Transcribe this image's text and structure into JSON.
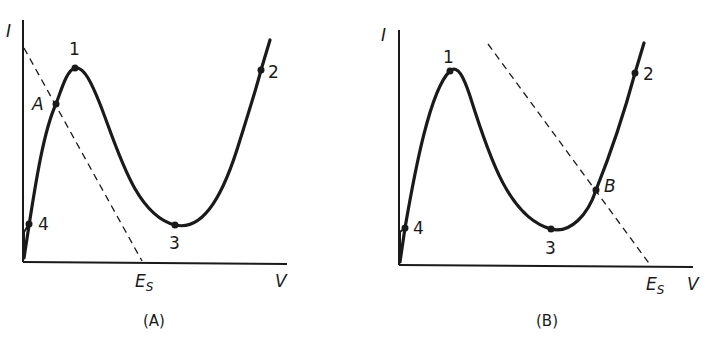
{
  "figure": {
    "panels": [
      {
        "caption": "(A)",
        "y_axis_label": "I",
        "x_axis_label": "V",
        "load_line_intercept_label": "E",
        "load_line_intercept_subscript": "S",
        "points": [
          {
            "label": "1",
            "meaning": "peak"
          },
          {
            "label": "2",
            "meaning": "upper branch"
          },
          {
            "label": "3",
            "meaning": "valley"
          },
          {
            "label": "4",
            "meaning": "lower branch"
          },
          {
            "label": "A",
            "meaning": "operating point (load line intersection)"
          }
        ]
      },
      {
        "caption": "(B)",
        "y_axis_label": "I",
        "x_axis_label": "V",
        "load_line_intercept_label": "E",
        "load_line_intercept_subscript": "S",
        "points": [
          {
            "label": "1",
            "meaning": "peak"
          },
          {
            "label": "2",
            "meaning": "upper branch"
          },
          {
            "label": "3",
            "meaning": "valley"
          },
          {
            "label": "4",
            "meaning": "lower branch"
          },
          {
            "label": "B",
            "meaning": "operating point (load line intersection)"
          }
        ]
      }
    ],
    "colors": {
      "ink": "#1a1a1a",
      "background": "#ffffff"
    }
  }
}
